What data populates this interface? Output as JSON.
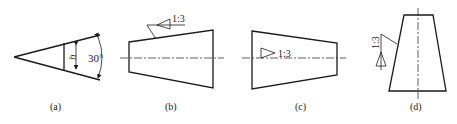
{
  "figures": [
    {
      "id": "a",
      "caption": "(a)",
      "dimension_label": "h",
      "angle_label": "30°"
    },
    {
      "id": "b",
      "caption": "(b)",
      "taper_label": "1:3"
    },
    {
      "id": "c",
      "caption": "(c)",
      "taper_label": "1:3"
    },
    {
      "id": "d",
      "caption": "(d)",
      "taper_label": "1:3"
    }
  ],
  "colors": {
    "stroke": "#1a1a1a",
    "background": "#ffffff"
  }
}
